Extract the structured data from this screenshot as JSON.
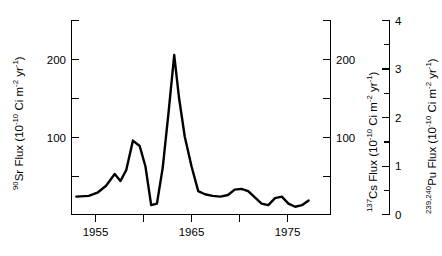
{
  "chart_data": {
    "type": "line",
    "title": "",
    "xlabel": "",
    "ylabel": "90Sr Flux (10-10 Ci m-2 yr-1)",
    "xlim": [
      1953,
      1977.5
    ],
    "x_ticks": [
      1955,
      1960,
      1965,
      1970,
      1975
    ],
    "x_tick_labels": [
      "1955",
      "",
      "1965",
      "",
      "1975"
    ],
    "grid": false,
    "legend": "none",
    "axes": [
      {
        "id": "left",
        "position": "left",
        "nuclide": "90Sr",
        "label_prefix_sup": "90",
        "label_element": "Sr Flux (10",
        "label_exp1": "-10",
        "label_mid": " Ci m",
        "label_exp2": "-2",
        "label_mid2": " yr",
        "label_exp3": "-1",
        "label_suffix": ")",
        "full_label": "90Sr Flux (10-10 Ci m-2 yr-1)",
        "ylim": [
          0,
          250
        ],
        "ticks": [
          0,
          50,
          100,
          150,
          200,
          250
        ],
        "tick_labels": [
          "",
          "",
          "100",
          "",
          "200",
          ""
        ]
      },
      {
        "id": "right-cs",
        "position": "right-inner",
        "nuclide": "137Cs",
        "label_prefix_sup": "137",
        "label_element": "Cs Flux (10",
        "label_exp1": "-10",
        "label_mid": " Ci m",
        "label_exp2": "-2",
        "label_mid2": " yr",
        "label_exp3": "-1",
        "label_suffix": ")",
        "full_label": "137Cs Flux (10-10 Ci m-2 yr-1)",
        "ylim": [
          0,
          250
        ],
        "ticks": [
          0,
          50,
          100,
          150,
          200,
          250
        ],
        "tick_labels": [
          "",
          "",
          "100",
          "",
          "200",
          ""
        ]
      },
      {
        "id": "right-pu",
        "position": "right-outer",
        "nuclide": "239,240Pu",
        "label_prefix_sup": "239,240",
        "label_element": "Pu Flux (10",
        "label_exp1": "-10",
        "label_mid": " Ci m",
        "label_exp2": "-2",
        "label_mid2": " yr",
        "label_exp3": "-1",
        "label_suffix": ")",
        "full_label": "239,240Pu Flux (10-10 Ci m-2 yr-1)",
        "ylim": [
          0,
          4.4
        ],
        "ticks": [
          0,
          0.5,
          1,
          1.5,
          2,
          2.5,
          3,
          3.5,
          4
        ],
        "tick_labels": [
          "0",
          "",
          "1",
          "",
          "2",
          "",
          "3",
          "",
          "4"
        ]
      }
    ],
    "series": [
      {
        "name": "90Sr Flux",
        "x": [
          1953.0,
          1954.3,
          1955.2,
          1956.1,
          1957.0,
          1957.6,
          1958.2,
          1958.9,
          1959.6,
          1960.2,
          1960.8,
          1961.4,
          1962.0,
          1962.6,
          1963.2,
          1963.7,
          1964.3,
          1965.0,
          1965.7,
          1966.4,
          1967.2,
          1968.0,
          1968.8,
          1969.5,
          1970.2,
          1970.9,
          1971.6,
          1972.3,
          1973.0,
          1973.7,
          1974.4,
          1975.1,
          1975.8,
          1976.5,
          1977.2
        ],
        "y": [
          23,
          24,
          28,
          37,
          52,
          43,
          57,
          95,
          88,
          62,
          12,
          14,
          60,
          130,
          205,
          150,
          100,
          62,
          30,
          26,
          24,
          23,
          25,
          32,
          33,
          30,
          22,
          14,
          12,
          21,
          23,
          14,
          10,
          12,
          18
        ]
      }
    ]
  },
  "figure": {
    "background_color": "#ffffff",
    "line_color": "#000000",
    "axis_color": "#000000"
  }
}
